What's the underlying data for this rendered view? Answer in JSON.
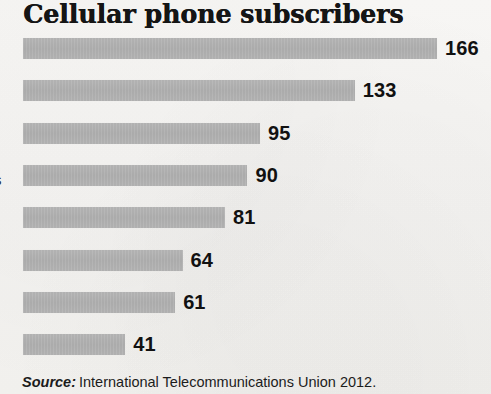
{
  "chart_data": {
    "type": "bar",
    "orientation": "horizontal",
    "title": "Cellular phone subscribers",
    "xlabel": "",
    "ylabel": "",
    "categories": [
      "",
      "",
      "",
      "",
      "",
      "",
      "",
      ""
    ],
    "values": [
      166,
      133,
      95,
      90,
      81,
      64,
      61,
      41
    ],
    "value_labels": [
      "166",
      "133",
      "95",
      "90",
      "81",
      "64",
      "61",
      "41"
    ],
    "xlim": [
      0,
      166
    ],
    "grid": false,
    "legend": null,
    "bar_color": "#aeaeae",
    "text_color": "#111111",
    "background_color": "#f4f3f1"
  },
  "title": {
    "text": "Cellular phone subscribers"
  },
  "axis": {
    "clipped_label_fragment": "s"
  },
  "source": {
    "prefix": "Source:",
    "text": "International Telecommunications Union 2012."
  }
}
